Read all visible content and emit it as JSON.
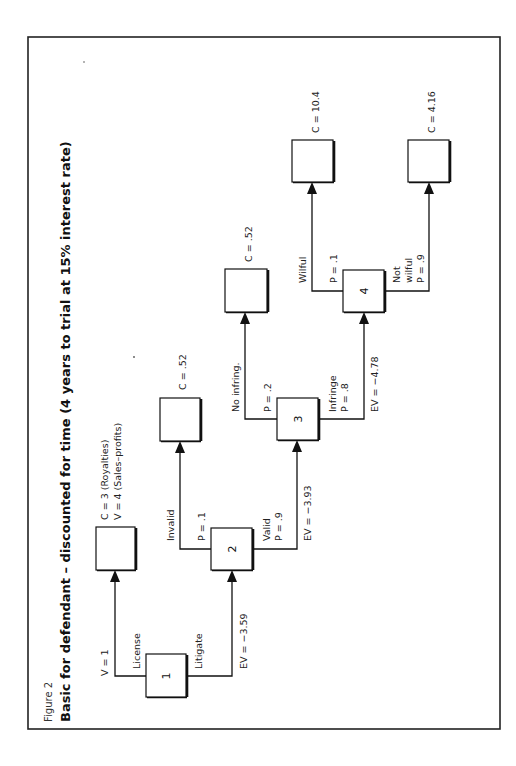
{
  "figure": {
    "label": "Figure 2",
    "title": "Basic for defendant – discounted for time (4 years to trial at 15% interest rate)",
    "orientation": "rotated 90° counter-clockwise"
  },
  "nodes": [
    {
      "id": "1",
      "label": "1",
      "type": "decision"
    },
    {
      "id": "2",
      "label": "2",
      "type": "chance"
    },
    {
      "id": "3",
      "label": "3",
      "type": "chance"
    },
    {
      "id": "4",
      "label": "4",
      "type": "chance"
    }
  ],
  "branches": {
    "license": {
      "name": "License",
      "value": "V = 1"
    },
    "litigate": {
      "name": "Litigate",
      "ev": "EV = −3.59"
    },
    "invalid": {
      "name": "Invalid",
      "prob": "P = .1"
    },
    "valid": {
      "name": "Valid",
      "prob": "P = .9",
      "ev": "EV = −3.93"
    },
    "no_infring": {
      "name": "No infring.",
      "prob": "P = .2"
    },
    "infringe": {
      "name": "Infringe",
      "prob": "P = .8",
      "ev": "EV = −4.78"
    },
    "wilful": {
      "name": "Wilful",
      "prob": "P = .1"
    },
    "not_wilful": {
      "name_line1": "Not",
      "name_line2": "wilful",
      "prob": "P = .9"
    }
  },
  "outcomes": {
    "license": {
      "line1": "C = 3 (Royalties)",
      "line2": "V = 4 (Sales–profits)"
    },
    "invalid": {
      "value": "C = .52"
    },
    "no_infring": {
      "value": "C = .52"
    },
    "wilful": {
      "value": "C = 10.4"
    },
    "not_wilful": {
      "value": "C = 4.16"
    }
  }
}
